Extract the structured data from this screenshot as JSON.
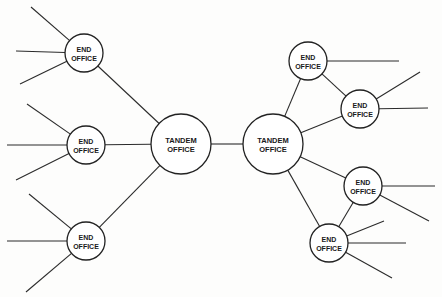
{
  "diagram": {
    "type": "network-topology",
    "colors": {
      "line": "#2b2b2b",
      "node_fill": "#ffffff",
      "text": "#1a1a1a",
      "background": "#fdfdfc"
    },
    "nodes": [
      {
        "id": "tandem-left",
        "kind": "tandem",
        "label_line1": "TANDEM",
        "label_line2": "OFFICE"
      },
      {
        "id": "tandem-right",
        "kind": "tandem",
        "label_line1": "TANDEM",
        "label_line2": "OFFICE"
      },
      {
        "id": "end-left-top",
        "kind": "end",
        "label_line1": "END",
        "label_line2": "OFFICE"
      },
      {
        "id": "end-left-middle",
        "kind": "end",
        "label_line1": "END",
        "label_line2": "OFFICE"
      },
      {
        "id": "end-left-bottom",
        "kind": "end",
        "label_line1": "END",
        "label_line2": "OFFICE"
      },
      {
        "id": "end-right-1",
        "kind": "end",
        "label_line1": "END",
        "label_line2": "OFFICE"
      },
      {
        "id": "end-right-2",
        "kind": "end",
        "label_line1": "END",
        "label_line2": "OFFICE"
      },
      {
        "id": "end-right-3",
        "kind": "end",
        "label_line1": "END",
        "label_line2": "OFFICE"
      },
      {
        "id": "end-right-4",
        "kind": "end",
        "label_line1": "END",
        "label_line2": "OFFICE"
      }
    ],
    "links": [
      {
        "from": "tandem-left",
        "to": "tandem-right"
      },
      {
        "from": "tandem-left",
        "to": "end-left-top"
      },
      {
        "from": "tandem-left",
        "to": "end-left-middle"
      },
      {
        "from": "tandem-left",
        "to": "end-left-bottom"
      },
      {
        "from": "tandem-right",
        "to": "end-right-1"
      },
      {
        "from": "tandem-right",
        "to": "end-right-2"
      },
      {
        "from": "tandem-right",
        "to": "end-right-3"
      },
      {
        "from": "tandem-right",
        "to": "end-right-4"
      },
      {
        "from": "end-right-1",
        "to": "end-right-2"
      },
      {
        "from": "end-right-3",
        "to": "end-right-4"
      }
    ],
    "subscriber_lines_per_node": {
      "end-left-top": 3,
      "end-left-middle": 3,
      "end-left-bottom": 3,
      "end-right-1": 1,
      "end-right-2": 2,
      "end-right-3": 2,
      "end-right-4": 3
    }
  }
}
